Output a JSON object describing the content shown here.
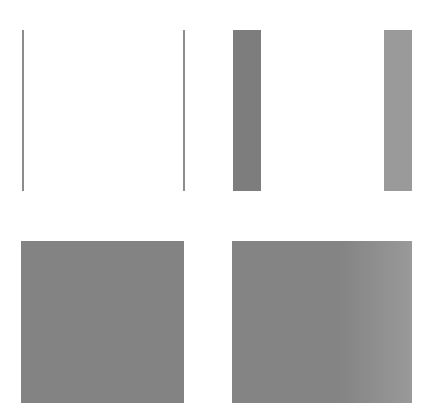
{
  "canvas": {
    "width": 430,
    "height": 420,
    "background": "#ffffff"
  },
  "shapes": [
    {
      "id": "line-left",
      "type": "vertical-line",
      "x": 22,
      "y": 30,
      "width": 2,
      "height": 161,
      "color": "#8c8c8c"
    },
    {
      "id": "line-right",
      "type": "vertical-line",
      "x": 183,
      "y": 30,
      "width": 2,
      "height": 161,
      "color": "#8c8c8c"
    },
    {
      "id": "bar-dark",
      "type": "vertical-bar",
      "x": 233,
      "y": 30,
      "width": 28,
      "height": 161,
      "color": "#7d7d7d"
    },
    {
      "id": "bar-light",
      "type": "vertical-bar",
      "x": 384,
      "y": 30,
      "width": 28,
      "height": 161,
      "color": "#9a9a9a"
    },
    {
      "id": "square-left",
      "type": "filled-rectangle",
      "x": 21,
      "y": 241,
      "width": 163,
      "height": 162,
      "color": "#838383"
    },
    {
      "id": "square-right",
      "type": "gradient-rectangle",
      "x": 232,
      "y": 241,
      "width": 180,
      "height": 162,
      "color_start": "#848484",
      "color_end": "#999999"
    }
  ]
}
